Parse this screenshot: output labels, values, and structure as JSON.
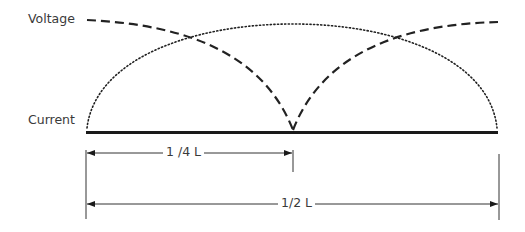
{
  "diagram": {
    "type": "standing-wave-voltage-current-distribution",
    "labels": {
      "voltage": "Voltage",
      "current": "Current",
      "quarter_length": "1 /4 L",
      "half_length": "1/2 L"
    },
    "curves": [
      {
        "name": "voltage",
        "style": "dashed",
        "description": "Voltage maximum at both ends, minimum (null) at center of half-wave"
      },
      {
        "name": "current",
        "style": "dotted",
        "description": "Current zero at both ends, maximum at center of half-wave"
      },
      {
        "name": "conductor",
        "style": "solid-thick",
        "description": "Antenna / conductor line"
      }
    ],
    "dimensions": [
      {
        "label": "1 /4 L",
        "from": "left end",
        "to": "center"
      },
      {
        "label": "1/2 L",
        "from": "left end",
        "to": "right end"
      }
    ],
    "colors": {
      "line": "#1a1a1a",
      "text": "#3a3a3a",
      "background": "#ffffff"
    }
  }
}
